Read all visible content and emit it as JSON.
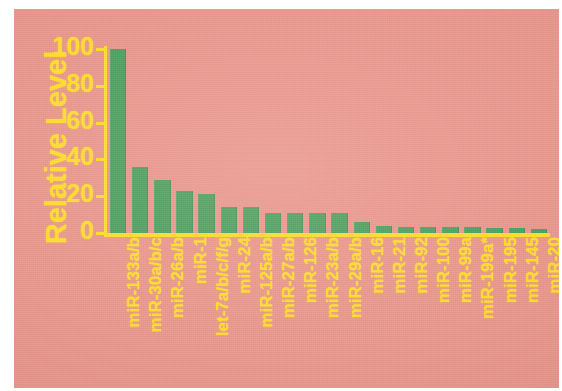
{
  "figure": {
    "background_color": "#e8948a",
    "bar_color": "#3c9d5a",
    "text_color": "#ffe01f",
    "border_color": "#ffffff"
  },
  "chart_data": {
    "type": "bar",
    "title": "",
    "subtitle": "",
    "xlabel": "",
    "ylabel": "Relative Level",
    "ylim": [
      0,
      100
    ],
    "yticks": [
      100,
      80,
      60,
      40,
      20,
      0
    ],
    "ytick_labels": [
      "100",
      "80",
      "60",
      "40",
      "20",
      "0"
    ],
    "grid": false,
    "legend": null,
    "legend_position": "none",
    "categories": [
      "miR-133a/b",
      "miR-30a/b/c",
      "miR-26a/b",
      "miR-1",
      "let-7a/b/c/f/g",
      "miR-24",
      "miR-125a/b",
      "miR-27a/b",
      "miR-126",
      "miR-23a/b",
      "miR-29a/b",
      "miR-16",
      "miR-21",
      "miR-92",
      "miR-100",
      "miR-99a",
      "miR-199a*",
      "miR-195",
      "miR-145",
      "miR-20"
    ],
    "values": [
      100,
      36,
      29,
      23,
      21,
      14,
      14,
      11,
      11,
      11,
      11,
      6,
      4,
      3.5,
      3,
      3,
      3,
      2.5,
      2.5,
      2
    ],
    "annotations": []
  }
}
